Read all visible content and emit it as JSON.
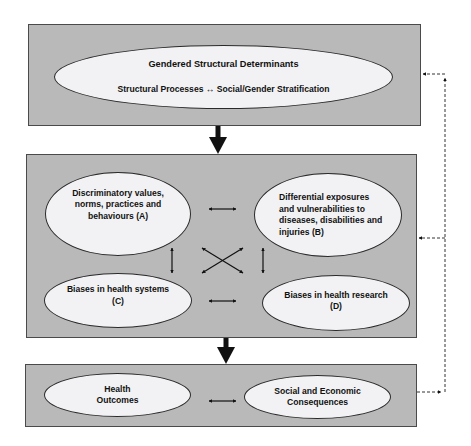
{
  "diagram": {
    "top_panel": {
      "title": "Gendered Structural Determinants",
      "subtitle": "Structural Processes ↔ Social/Gender Stratification"
    },
    "middle_panel": {
      "nodes": {
        "a": [
          "Discriminatory values,",
          "norms, practices and",
          "behaviours (A)"
        ],
        "b": [
          "Differential exposures",
          "and vulnerabilities to",
          "diseases, disabilities and",
          "injuries (B)"
        ],
        "c": [
          "Biases in health systems",
          "(C)"
        ],
        "d": [
          "Biases in health research",
          "(D)"
        ]
      }
    },
    "bottom_panel": {
      "nodes": {
        "outcomes": [
          "Health",
          "Outcomes"
        ],
        "consequences": [
          "Social and Economic",
          "Consequences"
        ]
      }
    },
    "connectors": {
      "solid_down_arrows": 2,
      "bidirectional_arrows": [
        "A-B",
        "A-C",
        "B-D",
        "C-D",
        "A-D",
        "B-C",
        "Outcomes-Consequences"
      ],
      "feedback_loop": "dashed line from bottom panel back to middle and top panels"
    },
    "colors": {
      "panel_fill": "#b9b9b9",
      "ellipse_fill": "#f2f2f4",
      "stroke": "#2a2a2a"
    }
  }
}
